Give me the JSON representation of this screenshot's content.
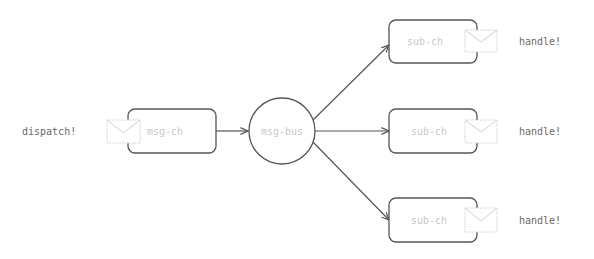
{
  "diagram": {
    "source": {
      "action_label": "dispatch!",
      "channel_label": "msg-ch"
    },
    "bus": {
      "label": "msg-bus"
    },
    "subscribers": [
      {
        "channel_label": "sub-ch",
        "action_label": "handle!"
      },
      {
        "channel_label": "sub-ch",
        "action_label": "handle!"
      },
      {
        "channel_label": "sub-ch",
        "action_label": "handle!"
      }
    ],
    "icons": {
      "message": "envelope-icon"
    },
    "colors": {
      "stroke": "#555555",
      "faint_text": "#c8c8c8",
      "dark_text": "#6a6a6a"
    }
  }
}
